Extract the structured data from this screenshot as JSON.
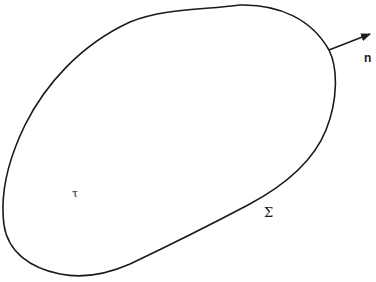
{
  "diagram": {
    "region_label": "τ",
    "boundary_label": "Σ",
    "normal_label": "n",
    "colors": {
      "background": "#ffffff",
      "stroke": "#1a1a1a"
    }
  }
}
